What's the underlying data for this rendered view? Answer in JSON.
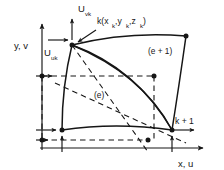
{
  "figure": {
    "type": "engineering-diagram",
    "title_visible": false,
    "background_color": "#ffffff",
    "stroke_color": "#161616",
    "labels": {
      "axis_y": "y, v",
      "axis_x": "x, u",
      "disp_v": "U",
      "disp_v_sub": "vk",
      "disp_u": "U",
      "disp_u_sub": "uk",
      "node_k": "k(x",
      "node_k_sub1": "k",
      "node_k_mid1": ",y",
      "node_k_sub2": "k",
      "node_k_mid2": ",z",
      "node_k_sub3": "k",
      "node_k_end": ")",
      "node_k1": "k + 1",
      "element_e": "(e)",
      "element_e1": "(e + 1)"
    },
    "geometry": {
      "y_axis_x": 42,
      "y_axis_top": 24,
      "y_axis_bottom": 150,
      "x_axis_y": 148,
      "x_axis_left": 40,
      "x_axis_right": 203,
      "node_k": [
        72,
        45
      ],
      "node_bottom_left": [
        62,
        130
      ],
      "node_bottom_right": [
        172,
        130
      ],
      "node_top_right": [
        186,
        36
      ],
      "projection_point_top": [
        154,
        76
      ],
      "projection_point_bottom": [
        148,
        148
      ],
      "dash_level_y": 76
    }
  }
}
